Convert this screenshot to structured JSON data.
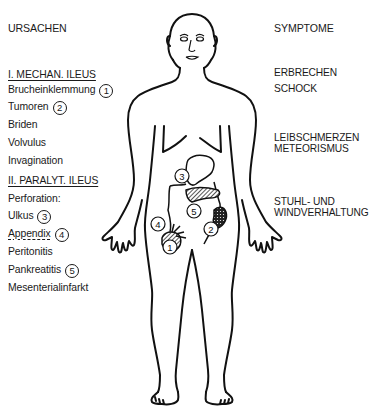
{
  "left_column": {
    "heading": "URSACHEN",
    "groups": [
      {
        "title": "I. MECHAN. ILEUS",
        "items": [
          {
            "label": "Brucheinklemmung",
            "marker": "1"
          },
          {
            "label": "Tumoren",
            "marker": "2"
          },
          {
            "label": "Briden",
            "marker": null
          },
          {
            "label": "Volvulus",
            "marker": null
          },
          {
            "label": "Invagination",
            "marker": null
          }
        ]
      },
      {
        "title": "II. PARALYT. ILEUS",
        "items": [
          {
            "label": "Perforation:",
            "marker": null
          },
          {
            "label": "Ulkus",
            "marker": "3"
          },
          {
            "label": "Appendix",
            "marker": "4"
          },
          {
            "label": "Peritonitis",
            "marker": null
          },
          {
            "label": "Pankreatitis",
            "marker": "5"
          },
          {
            "label": "Mesenterialinfarkt",
            "marker": null
          }
        ]
      }
    ]
  },
  "right_column": {
    "heading": "SYMPTOME",
    "symptoms": [
      {
        "line1": "ERBRECHEN",
        "line2": null
      },
      {
        "line1": "SCHOCK",
        "line2": null
      },
      {
        "line1": "LEIBSCHMERZEN",
        "line2": "METEORISMUS"
      },
      {
        "line1": "STUHL- UND",
        "line2": "WINDVERHALTUNG"
      }
    ]
  },
  "figure": {
    "markers": [
      "1",
      "2",
      "3",
      "4",
      "5"
    ],
    "stroke_color": "#111111"
  }
}
